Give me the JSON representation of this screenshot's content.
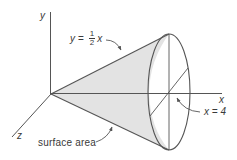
{
  "figure": {
    "colors": {
      "line": "#555555",
      "fill": "#e3e3e3",
      "text": "#3a3a3a",
      "background": "#ffffff"
    }
  },
  "axes": {
    "y_label": "y",
    "x_label": "x",
    "z_label": "z"
  },
  "labels": {
    "curve_equation": {
      "lhs": "y",
      "equals": "=",
      "fraction_numerator": "1",
      "fraction_denominator": "2",
      "rhs_variable": "x"
    },
    "boundary": "x = 4",
    "surface_area": "surface area"
  }
}
